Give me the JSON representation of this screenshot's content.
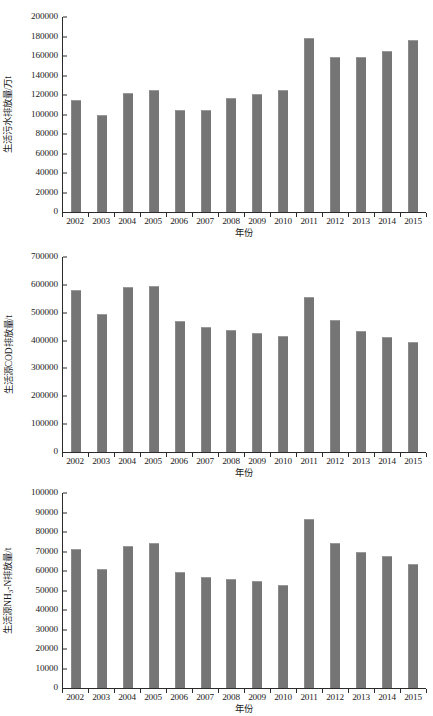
{
  "chart_data": [
    {
      "type": "bar",
      "id": "domestic-wastewater-discharge",
      "title": "",
      "xlabel": "年份",
      "ylabel": "生活污水排放量/万t",
      "categories": [
        "2002",
        "2003",
        "2004",
        "2005",
        "2006",
        "2007",
        "2008",
        "2009",
        "2010",
        "2011",
        "2012",
        "2013",
        "2014",
        "2015"
      ],
      "values": [
        115000,
        99000,
        122000,
        125500,
        104500,
        105000,
        116500,
        121000,
        125500,
        178000,
        158500,
        159000,
        165000,
        176500
      ],
      "ylim": [
        0,
        200000
      ],
      "ytick_step": 20000,
      "yticks": [
        "0",
        "20000",
        "40000",
        "60000",
        "80000",
        "100000",
        "120000",
        "140000",
        "160000",
        "180000",
        "200000"
      ],
      "grid": false,
      "legend": "none",
      "bar_color": "#757575"
    },
    {
      "type": "bar",
      "id": "domestic-cod-emission",
      "title": "",
      "xlabel": "年份",
      "ylabel": "生活源COD排放量/t",
      "categories": [
        "2002",
        "2003",
        "2004",
        "2005",
        "2006",
        "2007",
        "2008",
        "2009",
        "2010",
        "2011",
        "2012",
        "2013",
        "2014",
        "2015"
      ],
      "values": [
        580000,
        494000,
        592000,
        596000,
        471000,
        448000,
        438000,
        428000,
        417000,
        555000,
        473000,
        434000,
        413000,
        394000
      ],
      "ylim": [
        0,
        700000
      ],
      "ytick_step": 100000,
      "yticks": [
        "0",
        "100000",
        "200000",
        "300000",
        "400000",
        "500000",
        "600000",
        "700000"
      ],
      "grid": false,
      "legend": "none",
      "bar_color": "#757575"
    },
    {
      "type": "bar",
      "id": "domestic-ammonia-nitrogen-emission",
      "title": "",
      "xlabel": "年份",
      "ylabel": "生活源NH₃-N排放量/t",
      "ylabel_parts": {
        "pre": "生活源NH",
        "sub": "3",
        "post": "-N排放量/t"
      },
      "categories": [
        "2002",
        "2003",
        "2004",
        "2005",
        "2006",
        "2007",
        "2008",
        "2009",
        "2010",
        "2011",
        "2012",
        "2013",
        "2014",
        "2015"
      ],
      "values": [
        71200,
        61000,
        73000,
        74500,
        59300,
        57000,
        56000,
        54700,
        52800,
        86500,
        74200,
        70000,
        67500,
        63400
      ],
      "ylim": [
        0,
        100000
      ],
      "ytick_step": 10000,
      "yticks": [
        "0",
        "10000",
        "20000",
        "30000",
        "40000",
        "50000",
        "60000",
        "70000",
        "80000",
        "90000",
        "100000"
      ],
      "grid": false,
      "legend": "none",
      "bar_color": "#757575"
    }
  ]
}
